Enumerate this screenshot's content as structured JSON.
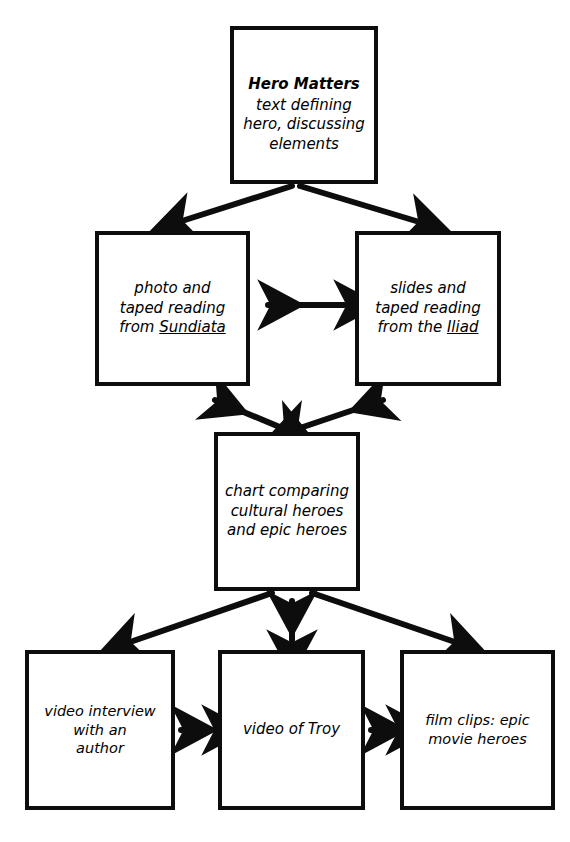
{
  "diagram": {
    "style": "hand-drawn black marker flowchart on white",
    "ink_color": "#0d0d0d",
    "background_color": "#ffffff",
    "nodes": [
      {
        "id": "hero-matters",
        "title": "Hero Matters",
        "text": "text defining\nhero, discussing\nelements",
        "row": 1
      },
      {
        "id": "sundiata",
        "text_before": "photo and\ntaped reading\nfrom ",
        "underlined": "Sundiata",
        "text_after": "",
        "full_text": "photo and taped reading from Sundiata",
        "row": 2
      },
      {
        "id": "iliad",
        "text_before": "slides and\ntaped reading\nfrom the ",
        "underlined": "Iliad",
        "text_after": "",
        "full_text": "slides and taped reading from the Iliad",
        "row": 2
      },
      {
        "id": "chart",
        "text": "chart comparing\ncultural heroes\nand epic heroes",
        "row": 3
      },
      {
        "id": "video-interview",
        "text": "video interview\nwith an\nauthor",
        "row": 4
      },
      {
        "id": "video-troy",
        "text": "video of Troy",
        "row": 4
      },
      {
        "id": "film-clips",
        "text": "film clips: epic\nmovie heroes",
        "row": 4
      }
    ],
    "connectors": [
      {
        "id": "hero-to-sundiata",
        "from": "hero-matters",
        "to": "sundiata",
        "heads": "single",
        "direction": "down-left"
      },
      {
        "id": "hero-to-iliad",
        "from": "hero-matters",
        "to": "iliad",
        "heads": "single",
        "direction": "down-right"
      },
      {
        "id": "sundiata-iliad",
        "from": "sundiata",
        "to": "iliad",
        "heads": "double",
        "direction": "horizontal"
      },
      {
        "id": "sundiata-chart",
        "from": "sundiata",
        "to": "chart",
        "heads": "double",
        "direction": "diagonal"
      },
      {
        "id": "iliad-chart",
        "from": "iliad",
        "to": "chart",
        "heads": "double",
        "direction": "diagonal"
      },
      {
        "id": "chart-to-interview",
        "from": "chart",
        "to": "video-interview",
        "heads": "single",
        "direction": "down-left"
      },
      {
        "id": "chart-troy",
        "from": "chart",
        "to": "video-troy",
        "heads": "double",
        "direction": "vertical"
      },
      {
        "id": "chart-to-filmclips",
        "from": "chart",
        "to": "film-clips",
        "heads": "single",
        "direction": "down-right"
      },
      {
        "id": "interview-troy",
        "from": "video-interview",
        "to": "video-troy",
        "heads": "double",
        "direction": "horizontal"
      },
      {
        "id": "troy-filmclips",
        "from": "video-troy",
        "to": "film-clips",
        "heads": "double",
        "direction": "horizontal"
      }
    ]
  }
}
